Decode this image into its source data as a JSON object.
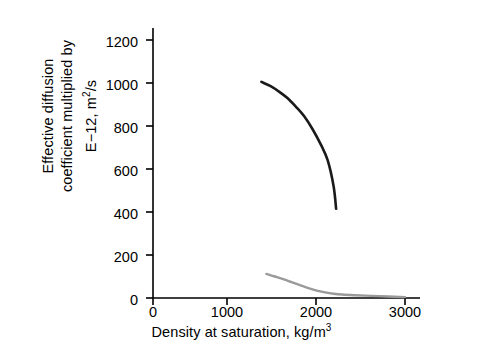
{
  "chart_data": {
    "type": "line",
    "title": "",
    "xlabel": "Density at saturation, kg/m3",
    "ylabel": "Effective diffusion coefficient multiplied by E−12, m2/s",
    "ylabel_line1": "Effective diffusion",
    "ylabel_line2": "coefficient multiplied by",
    "ylabel_line3": "E−12, m2/s",
    "xlim": [
      0,
      3000
    ],
    "ylim": [
      0,
      1200
    ],
    "xticks": [
      0,
      1000,
      2000,
      3000
    ],
    "yticks": [
      0,
      200,
      400,
      600,
      800,
      1000,
      1200
    ],
    "xtick_labels": [
      "0",
      "1000",
      "2000",
      "3000"
    ],
    "ytick_labels": [
      "0",
      "200",
      "400",
      "600",
      "800",
      "1000",
      "1200"
    ],
    "grid": false,
    "legend": "none",
    "series": [
      {
        "name": "upper-curve",
        "color": "#1a1a1a",
        "width": 2.6,
        "x": [
          1290,
          1400,
          1500,
          1600,
          1700,
          1800,
          1900,
          2000,
          2080,
          2150,
          2180
        ],
        "y": [
          1005,
          985,
          960,
          930,
          890,
          845,
          785,
          712,
          640,
          520,
          415
        ]
      },
      {
        "name": "lower-curve",
        "color": "#9a9a9a",
        "width": 2.4,
        "x": [
          1350,
          1450,
          1550,
          1650,
          1750,
          1850,
          1950,
          2050,
          2150,
          2250,
          2400,
          2600,
          2800,
          3000
        ],
        "y": [
          112,
          100,
          88,
          74,
          60,
          46,
          34,
          26,
          20,
          16,
          13,
          10,
          7,
          4
        ]
      }
    ]
  },
  "axis": {
    "x_title_prefix": "Density at saturation, kg/m",
    "x_title_exponent": "3",
    "y_title_l1": "Effective diffusion",
    "y_title_l2": "coefficient multiplied by",
    "y_title_l3_prefix": "E−12, m",
    "y_title_l3_exponent": "2",
    "y_title_l3_suffix": "/s"
  }
}
